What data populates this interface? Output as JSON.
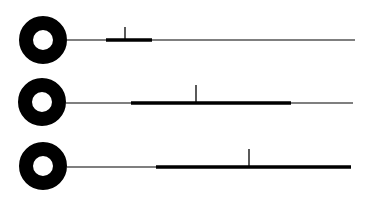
{
  "diagram": {
    "type": "pin-timeline-rows",
    "background": "#ffffff",
    "ink_color": "#000000",
    "rows": [
      {
        "ring": {
          "cx": 43,
          "cy": 40,
          "r_outer": 24,
          "r_inner": 10
        },
        "line": {
          "y": 40,
          "x_start": 67,
          "x_end": 355,
          "thickness": 1.2
        },
        "bar": {
          "x_start": 106,
          "x_end": 152,
          "thickness": 3.5
        },
        "tick": {
          "x": 125,
          "y_top": 27
        }
      },
      {
        "ring": {
          "cx": 42,
          "cy": 102,
          "r_outer": 24,
          "r_inner": 10
        },
        "line": {
          "y": 103,
          "x_start": 66,
          "x_end": 353,
          "thickness": 1.2
        },
        "bar": {
          "x_start": 131,
          "x_end": 291,
          "thickness": 3.5
        },
        "tick": {
          "x": 196,
          "y_top": 85
        }
      },
      {
        "ring": {
          "cx": 43,
          "cy": 166,
          "r_outer": 24,
          "r_inner": 10
        },
        "line": {
          "y": 167,
          "x_start": 67,
          "x_end": 351,
          "thickness": 1.2
        },
        "bar": {
          "x_start": 156,
          "x_end": 351,
          "thickness": 3.5
        },
        "tick": {
          "x": 249,
          "y_top": 149
        }
      }
    ]
  }
}
